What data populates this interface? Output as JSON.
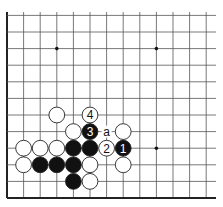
{
  "board": {
    "cols": 13,
    "rows": 12,
    "origin_x": 7,
    "origin_y": 198,
    "spacing_x": 16.6,
    "spacing_y": 16.6,
    "line_color": "#555555",
    "edge_color": "#222222",
    "star_points": [
      [
        3,
        9
      ],
      [
        9,
        9
      ],
      [
        9,
        3
      ]
    ],
    "stones": [
      {
        "col": 3,
        "row": 5,
        "color": "white",
        "label": ""
      },
      {
        "col": 5,
        "row": 5,
        "color": "white",
        "label": "4"
      },
      {
        "col": 4,
        "row": 4,
        "color": "white",
        "label": ""
      },
      {
        "col": 5,
        "row": 4,
        "color": "black",
        "label": "3"
      },
      {
        "col": 7,
        "row": 4,
        "color": "white",
        "label": ""
      },
      {
        "col": 1,
        "row": 3,
        "color": "white",
        "label": ""
      },
      {
        "col": 2,
        "row": 3,
        "color": "white",
        "label": ""
      },
      {
        "col": 3,
        "row": 3,
        "color": "white",
        "label": ""
      },
      {
        "col": 4,
        "row": 3,
        "color": "black",
        "label": ""
      },
      {
        "col": 5,
        "row": 3,
        "color": "black",
        "label": ""
      },
      {
        "col": 6,
        "row": 3,
        "color": "white",
        "label": "2"
      },
      {
        "col": 7,
        "row": 3,
        "color": "black",
        "label": "1"
      },
      {
        "col": 1,
        "row": 2,
        "color": "white",
        "label": ""
      },
      {
        "col": 2,
        "row": 2,
        "color": "black",
        "label": ""
      },
      {
        "col": 3,
        "row": 2,
        "color": "black",
        "label": ""
      },
      {
        "col": 4,
        "row": 2,
        "color": "black",
        "label": ""
      },
      {
        "col": 5,
        "row": 2,
        "color": "white",
        "label": ""
      },
      {
        "col": 7,
        "row": 2,
        "color": "white",
        "label": ""
      },
      {
        "col": 4,
        "row": 1,
        "color": "black",
        "label": ""
      },
      {
        "col": 5,
        "row": 1,
        "color": "white",
        "label": ""
      }
    ],
    "markers": [
      {
        "col": 6,
        "row": 4,
        "label": "a"
      }
    ]
  }
}
